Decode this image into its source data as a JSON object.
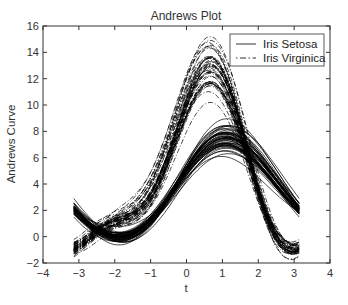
{
  "chart_data": {
    "type": "line",
    "title": "Andrews Plot",
    "xlabel": "t",
    "ylabel": "Andrews Curve",
    "xlim": [
      -4,
      4
    ],
    "ylim": [
      -2,
      16
    ],
    "x_ticks": [
      -4,
      -3,
      -2,
      -1,
      0,
      1,
      2,
      3,
      4
    ],
    "y_ticks": [
      -2,
      0,
      2,
      4,
      6,
      8,
      10,
      12,
      14,
      16
    ],
    "t_range": [
      -3.14159,
      3.14159
    ],
    "formula": "f(t) = x1/sqrt(2) + x2*sin(t) + x3*cos(t) + x4*sin(2t)",
    "grid": false,
    "legend_position": "upper right",
    "legend": [
      {
        "label": "Iris Setosa",
        "style": "solid"
      },
      {
        "label": "Iris Virginica",
        "style": "dash-dot"
      }
    ],
    "series": [
      {
        "name": "Iris Setosa",
        "style": "solid",
        "color": "#000000",
        "samples": [
          [
            5.1,
            3.5,
            1.4,
            0.2
          ],
          [
            4.9,
            3.0,
            1.4,
            0.2
          ],
          [
            4.7,
            3.2,
            1.3,
            0.2
          ],
          [
            4.6,
            3.1,
            1.5,
            0.2
          ],
          [
            5.0,
            3.6,
            1.4,
            0.2
          ],
          [
            5.4,
            3.9,
            1.7,
            0.4
          ],
          [
            4.6,
            3.4,
            1.4,
            0.3
          ],
          [
            5.0,
            3.4,
            1.5,
            0.2
          ],
          [
            4.4,
            2.9,
            1.4,
            0.2
          ],
          [
            4.9,
            3.1,
            1.5,
            0.1
          ],
          [
            5.4,
            3.7,
            1.5,
            0.2
          ],
          [
            4.8,
            3.4,
            1.6,
            0.2
          ],
          [
            4.8,
            3.0,
            1.4,
            0.1
          ],
          [
            4.3,
            3.0,
            1.1,
            0.1
          ],
          [
            5.8,
            4.0,
            1.2,
            0.2
          ],
          [
            5.7,
            4.4,
            1.5,
            0.4
          ],
          [
            5.4,
            3.9,
            1.3,
            0.4
          ],
          [
            5.1,
            3.5,
            1.4,
            0.3
          ],
          [
            5.7,
            3.8,
            1.7,
            0.3
          ],
          [
            5.1,
            3.8,
            1.5,
            0.3
          ],
          [
            5.4,
            3.4,
            1.7,
            0.2
          ],
          [
            5.1,
            3.7,
            1.5,
            0.4
          ],
          [
            4.6,
            3.6,
            1.0,
            0.2
          ],
          [
            5.1,
            3.3,
            1.7,
            0.5
          ],
          [
            4.8,
            3.4,
            1.9,
            0.2
          ],
          [
            5.0,
            3.0,
            1.6,
            0.2
          ],
          [
            5.0,
            3.4,
            1.6,
            0.4
          ],
          [
            5.2,
            3.5,
            1.5,
            0.2
          ],
          [
            5.2,
            3.4,
            1.4,
            0.2
          ],
          [
            4.7,
            3.2,
            1.6,
            0.2
          ],
          [
            4.8,
            3.1,
            1.6,
            0.2
          ],
          [
            5.4,
            3.4,
            1.5,
            0.4
          ],
          [
            5.2,
            4.1,
            1.5,
            0.1
          ],
          [
            5.5,
            4.2,
            1.4,
            0.2
          ],
          [
            4.9,
            3.1,
            1.5,
            0.2
          ],
          [
            5.0,
            3.2,
            1.2,
            0.2
          ],
          [
            5.5,
            3.5,
            1.3,
            0.2
          ],
          [
            4.9,
            3.6,
            1.4,
            0.1
          ],
          [
            4.4,
            3.0,
            1.3,
            0.2
          ],
          [
            5.1,
            3.4,
            1.5,
            0.2
          ],
          [
            5.0,
            3.5,
            1.3,
            0.3
          ],
          [
            4.5,
            2.3,
            1.3,
            0.3
          ],
          [
            4.4,
            3.2,
            1.3,
            0.2
          ],
          [
            5.0,
            3.5,
            1.6,
            0.6
          ],
          [
            5.1,
            3.8,
            1.9,
            0.4
          ],
          [
            4.8,
            3.0,
            1.4,
            0.3
          ],
          [
            5.1,
            3.8,
            1.6,
            0.2
          ],
          [
            4.6,
            3.2,
            1.4,
            0.2
          ],
          [
            5.3,
            3.7,
            1.5,
            0.2
          ],
          [
            5.0,
            3.3,
            1.4,
            0.2
          ]
        ]
      },
      {
        "name": "Iris Virginica",
        "style": "dash-dot",
        "color": "#000000",
        "samples": [
          [
            6.3,
            3.3,
            6.0,
            2.5
          ],
          [
            5.8,
            2.7,
            5.1,
            1.9
          ],
          [
            7.1,
            3.0,
            5.9,
            2.1
          ],
          [
            6.3,
            2.9,
            5.6,
            1.8
          ],
          [
            6.5,
            3.0,
            5.8,
            2.2
          ],
          [
            7.6,
            3.0,
            6.6,
            2.1
          ],
          [
            4.9,
            2.5,
            4.5,
            1.7
          ],
          [
            7.3,
            2.9,
            6.3,
            1.8
          ],
          [
            6.7,
            2.5,
            5.8,
            1.8
          ],
          [
            7.2,
            3.6,
            6.1,
            2.5
          ],
          [
            6.5,
            3.2,
            5.1,
            2.0
          ],
          [
            6.4,
            2.7,
            5.3,
            1.9
          ],
          [
            6.8,
            3.0,
            5.5,
            2.1
          ],
          [
            5.7,
            2.5,
            5.0,
            2.0
          ],
          [
            5.8,
            2.8,
            5.1,
            2.4
          ],
          [
            6.4,
            3.2,
            5.3,
            2.3
          ],
          [
            6.5,
            3.0,
            5.5,
            1.8
          ],
          [
            7.7,
            3.8,
            6.7,
            2.2
          ],
          [
            7.7,
            2.6,
            6.9,
            2.3
          ],
          [
            6.0,
            2.2,
            5.0,
            1.5
          ],
          [
            6.9,
            3.2,
            5.7,
            2.3
          ],
          [
            5.6,
            2.8,
            4.9,
            2.0
          ],
          [
            7.7,
            2.8,
            6.7,
            2.0
          ],
          [
            6.3,
            2.7,
            4.9,
            1.8
          ],
          [
            6.7,
            3.3,
            5.7,
            2.1
          ],
          [
            7.2,
            3.2,
            6.0,
            1.8
          ],
          [
            6.2,
            2.8,
            4.8,
            1.8
          ],
          [
            6.1,
            3.0,
            4.9,
            1.8
          ],
          [
            6.4,
            2.8,
            5.6,
            2.1
          ],
          [
            7.2,
            3.0,
            5.8,
            1.6
          ],
          [
            7.4,
            2.8,
            6.1,
            1.9
          ],
          [
            7.9,
            3.8,
            6.4,
            2.0
          ],
          [
            6.4,
            2.8,
            5.6,
            2.2
          ],
          [
            6.3,
            2.8,
            5.1,
            1.5
          ],
          [
            6.1,
            2.6,
            5.6,
            1.4
          ],
          [
            7.7,
            3.0,
            6.1,
            2.3
          ],
          [
            6.3,
            3.4,
            5.6,
            2.4
          ],
          [
            6.4,
            3.1,
            5.5,
            1.8
          ],
          [
            6.0,
            3.0,
            4.8,
            1.8
          ],
          [
            6.9,
            3.1,
            5.4,
            2.1
          ],
          [
            6.7,
            3.1,
            5.6,
            2.4
          ],
          [
            6.9,
            3.1,
            5.1,
            2.3
          ],
          [
            5.8,
            2.7,
            5.1,
            1.9
          ],
          [
            6.8,
            3.2,
            5.9,
            2.3
          ],
          [
            6.7,
            3.3,
            5.7,
            2.5
          ],
          [
            6.7,
            3.0,
            5.2,
            2.3
          ],
          [
            6.3,
            2.5,
            5.0,
            1.9
          ],
          [
            6.5,
            3.0,
            5.2,
            2.0
          ],
          [
            6.2,
            3.4,
            5.4,
            2.3
          ],
          [
            5.9,
            3.0,
            5.1,
            1.8
          ]
        ]
      }
    ],
    "summary": {
      "Iris Setosa": {
        "at_t_minus_pi": 2.1,
        "at_t_0": 5.0,
        "peak_t": 1.2,
        "peak_y": 7.5,
        "at_t_pi": 2.1
      },
      "Iris Virginica": {
        "at_t_minus_pi": -0.9,
        "at_t_0": 10.2,
        "peak_t": 0.7,
        "peak_y": 12.8,
        "at_t_pi": -0.9
      }
    }
  }
}
